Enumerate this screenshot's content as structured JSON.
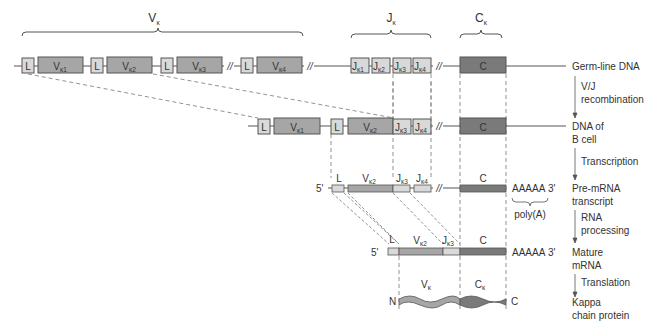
{
  "colors": {
    "light_segment": "#d9d9d9",
    "v_segment": "#a6a6a6",
    "c_segment": "#7a7a7a",
    "line": "#555555",
    "dash": "#777777",
    "text": "#333333"
  },
  "region_labels": {
    "v_kappa": {
      "main": "V",
      "sub": "κ"
    },
    "j_kappa": {
      "main": "J",
      "sub": "κ"
    },
    "c_kappa": {
      "main": "C",
      "sub": "κ"
    }
  },
  "germline": {
    "label": "Germ-line DNA",
    "segments": [
      {
        "type": "L",
        "text": "L"
      },
      {
        "type": "V",
        "main": "V",
        "sub": "κ1"
      },
      {
        "type": "L",
        "text": "L"
      },
      {
        "type": "V",
        "main": "V",
        "sub": "κ2"
      },
      {
        "type": "L",
        "text": "L"
      },
      {
        "type": "V",
        "main": "V",
        "sub": "κ3"
      },
      {
        "type": "L",
        "text": "L"
      },
      {
        "type": "V",
        "main": "V",
        "sub": "κ4"
      },
      {
        "type": "J",
        "main": "J",
        "sub": "κ1"
      },
      {
        "type": "J",
        "main": "J",
        "sub": "κ2"
      },
      {
        "type": "J",
        "main": "J",
        "sub": "κ3"
      },
      {
        "type": "J",
        "main": "J",
        "sub": "κ4"
      },
      {
        "type": "C",
        "text": "C"
      }
    ],
    "break_mark": "//"
  },
  "steps": {
    "recombination": {
      "line1": "V/J",
      "line2": "recombination"
    },
    "transcription": "Transcription",
    "rna_processing": {
      "line1": "RNA",
      "line2": "processing"
    },
    "translation": "Translation"
  },
  "bcell_dna": {
    "label_line1": "DNA of",
    "label_line2": "B cell",
    "segments": [
      {
        "type": "L",
        "text": "L"
      },
      {
        "type": "V",
        "main": "V",
        "sub": "κ1"
      },
      {
        "type": "L",
        "text": "L"
      },
      {
        "type": "V",
        "main": "V",
        "sub": "κ2"
      },
      {
        "type": "J",
        "main": "J",
        "sub": "κ3"
      },
      {
        "type": "J",
        "main": "J",
        "sub": "κ4"
      },
      {
        "type": "C",
        "text": "C"
      }
    ]
  },
  "pre_mrna": {
    "label_line1": "Pre-mRNA",
    "label_line2": "transcript",
    "five_prime": "5'",
    "three_prime": "3'",
    "tail": "AAAAA",
    "poly_a": "poly(A)",
    "segment_labels": [
      {
        "main": "L",
        "sub": ""
      },
      {
        "main": "V",
        "sub": "κ2"
      },
      {
        "main": "J",
        "sub": "κ3"
      },
      {
        "main": "J",
        "sub": "κ4"
      },
      {
        "main": "C",
        "sub": ""
      }
    ]
  },
  "mature_mrna": {
    "label_line1": "Mature",
    "label_line2": "mRNA",
    "five_prime": "5'",
    "three_prime": "3'",
    "tail": "AAAAA",
    "segment_labels": [
      {
        "main": "L",
        "sub": ""
      },
      {
        "main": "V",
        "sub": "κ2"
      },
      {
        "main": "J",
        "sub": "κ3"
      },
      {
        "main": "C",
        "sub": ""
      }
    ]
  },
  "protein": {
    "label_line1": "Kappa",
    "label_line2": "chain protein",
    "n_term": "N",
    "c_term": "C",
    "v_label": {
      "main": "V",
      "sub": "κ"
    },
    "c_label": {
      "main": "C",
      "sub": "κ"
    }
  }
}
